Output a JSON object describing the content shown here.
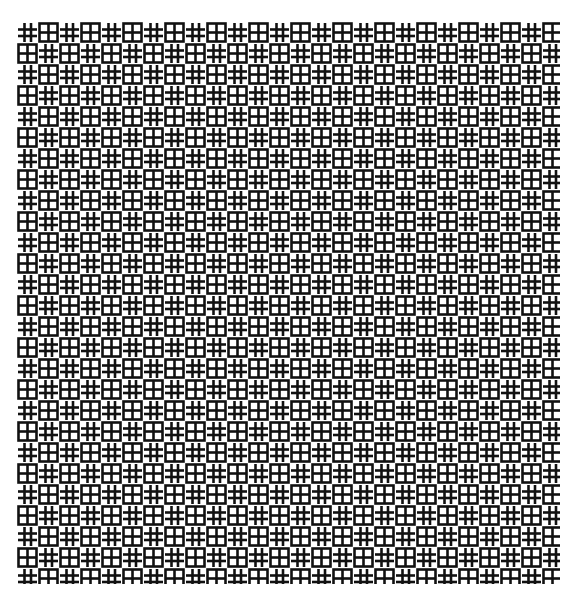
{
  "image": {
    "description": "Black and white geometric lattice pattern",
    "motifs": [
      "hash-grid",
      "boxed-grid"
    ],
    "arrangement": "checkerboard",
    "colors": {
      "ink": "#111111",
      "paper": "#ffffff"
    },
    "motif_pitch_px": 21
  }
}
